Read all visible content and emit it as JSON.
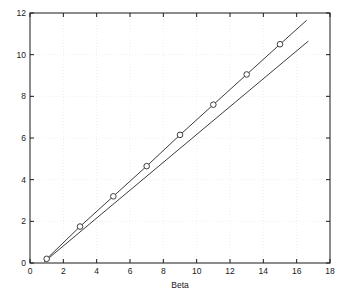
{
  "figure": {
    "background_color": "#ffffff",
    "axes_color": "#1a1a1a",
    "grid_color": "#efefef",
    "line_color": "#3c3c3c",
    "marker_edge_color": "#3c3c3c",
    "marker_face_color": "#ffffff",
    "plot_box": {
      "left": 30,
      "top": 13,
      "right": 330,
      "bottom": 263
    }
  },
  "chart_data": {
    "type": "line",
    "title": "",
    "xlabel": "Beta",
    "ylabel": "",
    "xlim": [
      0,
      18
    ],
    "ylim": [
      0,
      12
    ],
    "xticks": [
      0,
      2,
      4,
      6,
      8,
      10,
      12,
      14,
      16,
      18
    ],
    "xtick_labels": [
      "0",
      "2",
      "4",
      "6",
      "8",
      "10",
      "12",
      "14",
      "16",
      "18"
    ],
    "yticks": [
      0,
      2,
      4,
      6,
      8,
      10,
      12
    ],
    "ytick_labels": [
      "0",
      "2",
      "4",
      "6",
      "8",
      "10",
      "12"
    ],
    "grid": true,
    "legend": null,
    "legend_position": "none",
    "series": [
      {
        "name": "data",
        "marker": "circle",
        "line_style": "solid",
        "x": [
          1,
          3,
          5,
          7,
          9,
          11,
          13,
          15,
          16.6
        ],
        "y": [
          0.2,
          1.75,
          3.2,
          4.65,
          6.15,
          7.6,
          9.05,
          10.5,
          11.65
        ]
      },
      {
        "name": "reference-line",
        "marker": "none",
        "line_style": "solid",
        "x": [
          0.85,
          16.7
        ],
        "y": [
          0.05,
          10.65
        ]
      }
    ]
  }
}
